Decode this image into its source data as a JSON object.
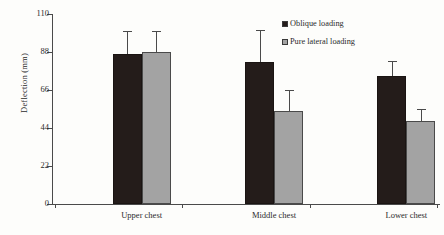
{
  "chart_data": {
    "type": "bar",
    "title": "",
    "subtitle": "",
    "xlabel": "",
    "ylabel": "Deflection (mm)",
    "categories": [
      "Upper chest",
      "Middle chest",
      "Lower chest"
    ],
    "ylim": [
      0,
      110
    ],
    "yticks": [
      0,
      22,
      44,
      66,
      88,
      110
    ],
    "ytick_labels": [
      "0",
      "22",
      "44",
      "66",
      "88",
      "110"
    ],
    "grid": false,
    "legend_position": "top-right",
    "series": [
      {
        "name": "Oblique loading",
        "color": "#241c1a",
        "values": [
          87,
          82,
          74
        ],
        "errors": [
          13,
          19,
          9
        ]
      },
      {
        "name": "Pure lateral loading",
        "color": "#a3a3a3",
        "values": [
          88,
          54,
          48
        ],
        "errors": [
          12,
          12,
          7
        ]
      }
    ]
  },
  "legend": {
    "items": [
      {
        "label": "Oblique loading",
        "swatch": "black-square-icon"
      },
      {
        "label": "Pure lateral loading",
        "swatch": "gray-square-icon"
      }
    ]
  }
}
